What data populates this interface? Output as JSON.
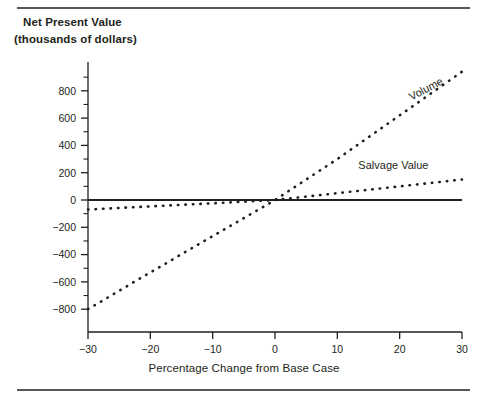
{
  "figure": {
    "title_line1": "Net Present Value",
    "title_line2": "(thousands of dollars)",
    "xaxis_title": "Percentage Change from Base Case",
    "top_rule": "horizontal-rule",
    "bottom_rule": "horizontal-rule"
  },
  "chart_data": {
    "type": "line",
    "title": "Net Present Value (thousands of dollars)",
    "xlabel": "Percentage Change from Base Case",
    "ylabel": "Net Present Value (thousands of dollars)",
    "xlim": [
      -30,
      30
    ],
    "ylim": [
      -900,
      950
    ],
    "grid": false,
    "legend_position": "inline-labels",
    "x_ticks": [
      -30,
      -20,
      -10,
      0,
      10,
      20,
      30
    ],
    "x_tick_labels": [
      "-30",
      "-20",
      "-10",
      "0",
      "10",
      "20",
      "30"
    ],
    "y_ticks": [
      800,
      600,
      400,
      200,
      0,
      -200,
      -400,
      -600,
      -800
    ],
    "y_tick_labels": [
      "800",
      "600",
      "400",
      "200",
      "0",
      "-200",
      "-400",
      "-600",
      "-800"
    ],
    "y_minor_ticks": [
      900,
      700,
      500,
      300,
      100,
      -100,
      -300,
      -500,
      -700
    ],
    "x": [
      -30,
      -20,
      -10,
      0,
      10,
      20,
      30
    ],
    "series": [
      {
        "name": "Volume",
        "style": "dotted",
        "color": "#231f20",
        "values": [
          -800,
          -530,
          -265,
          0,
          300,
          620,
          940
        ]
      },
      {
        "name": "Salvage Value",
        "style": "dotted",
        "color": "#231f20",
        "values": [
          -70,
          -47,
          -24,
          0,
          50,
          100,
          150
        ]
      },
      {
        "name": "Zero Baseline",
        "style": "solid",
        "color": "#231f20",
        "values": [
          0,
          0,
          0,
          0,
          0,
          0,
          0
        ]
      }
    ],
    "annotations": [
      {
        "text": "Volume",
        "x": 24.5,
        "y": 790,
        "rotation": -28
      },
      {
        "text": "Salvage Value",
        "x": 19,
        "y": 230,
        "rotation": 0
      }
    ]
  }
}
